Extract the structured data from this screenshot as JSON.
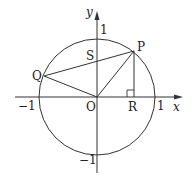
{
  "diagram": {
    "type": "unit-circle-geometry",
    "axes": {
      "x_label": "x",
      "y_label": "y",
      "ticks": {
        "x_neg": "−1",
        "x_pos": "1",
        "y_pos": "1",
        "y_neg": "−1"
      }
    },
    "points": {
      "O": {
        "label": "O"
      },
      "P": {
        "label": "P"
      },
      "Q": {
        "label": "Q"
      },
      "R": {
        "label": "R"
      },
      "S": {
        "label": "S"
      }
    },
    "segments": [
      "OP",
      "OQ",
      "PQ",
      "PR"
    ],
    "right_angle_at": "R",
    "colors": {
      "stroke": "#333333",
      "text": "#222222"
    }
  }
}
